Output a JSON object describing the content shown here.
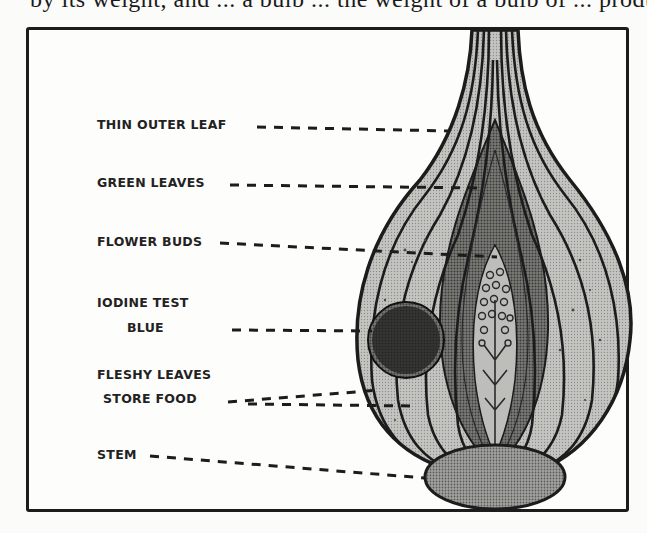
{
  "page": {
    "top_text_cropped": "by its weight, and ... a bulb ... the weight of a bulb of ... produces"
  },
  "diagram": {
    "colors": {
      "ink": "#1c1c1c",
      "fleshy_leaf_fill": "#b9b9b6",
      "inner_leaf_fill": "#6f6f6c",
      "iodine_blue": "#232323",
      "stem_fill": "#8a8a87",
      "paper": "#fdfdfc"
    },
    "labels": [
      {
        "id": "thin-outer-leaf",
        "text": "THIN OUTER LEAF"
      },
      {
        "id": "green-leaves",
        "text": "GREEN LEAVES"
      },
      {
        "id": "flower-buds",
        "text": "FLOWER BUDS"
      },
      {
        "id": "iodine-test-line1",
        "text": "IODINE TEST"
      },
      {
        "id": "iodine-test-line2",
        "text": "BLUE"
      },
      {
        "id": "fleshy-leaves-line1",
        "text": "FLESHY LEAVES"
      },
      {
        "id": "fleshy-leaves-line2",
        "text": "STORE FOOD"
      },
      {
        "id": "stem",
        "text": "STEM"
      }
    ]
  }
}
